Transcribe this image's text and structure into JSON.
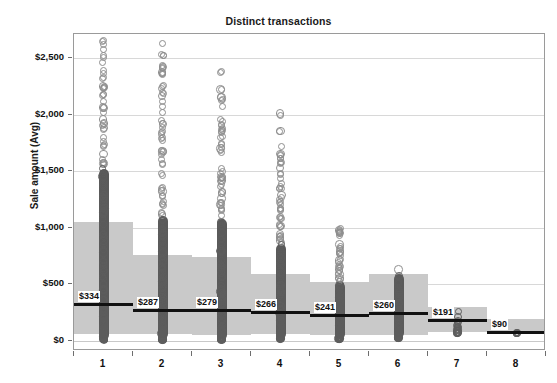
{
  "chart_data": {
    "type": "scatter",
    "title": "Distinct transactions",
    "xlabel": "",
    "ylabel": "Sale amount (Avg)",
    "ylim": [
      -120,
      2800
    ],
    "yticks": [
      0,
      500,
      1000,
      1500,
      2000,
      2500
    ],
    "ytick_labels": [
      "$0",
      "$500",
      "$1,000",
      "$1,500",
      "$2,000",
      "$2,500"
    ],
    "grid": true,
    "legend": "none",
    "categories": [
      "1",
      "2",
      "3",
      "4",
      "5",
      "6",
      "7",
      "8"
    ],
    "xtick_labels": [
      "1",
      "2",
      "3",
      "4",
      "5",
      "6",
      "7",
      "8"
    ],
    "series": [
      {
        "name": "Sale amount (Avg) mean",
        "type": "reference-line",
        "values": [
          334,
          287,
          279,
          266,
          241,
          260,
          191,
          90
        ],
        "labels": [
          "$334",
          "$287",
          "$279",
          "$266",
          "$241",
          "$260",
          "$191",
          "$90"
        ]
      },
      {
        "name": "Distribution band",
        "type": "band",
        "band_top": [
          1050,
          760,
          745,
          590,
          520,
          595,
          300,
          190
        ],
        "band_bottom": [
          60,
          60,
          60,
          60,
          55,
          60,
          75,
          55
        ]
      },
      {
        "name": "Transaction points",
        "type": "scatter-column",
        "point_counts": [
          2000,
          1200,
          700,
          300,
          150,
          90,
          22,
          8
        ],
        "max_values": [
          2800,
          2650,
          2450,
          2030,
          1000,
          640,
          260,
          120
        ],
        "min_values": [
          15,
          15,
          15,
          20,
          20,
          30,
          70,
          60
        ]
      }
    ]
  },
  "labels": {
    "title": "Distinct transactions",
    "y_axis_title": "Sale amount (Avg)"
  },
  "colors": {
    "band": "#c9c9c9",
    "refline": "#111111",
    "point_stroke": "#8e8e8e",
    "grid": "#d8d8d8",
    "frame": "#9a9a9a",
    "text": "#111111"
  }
}
